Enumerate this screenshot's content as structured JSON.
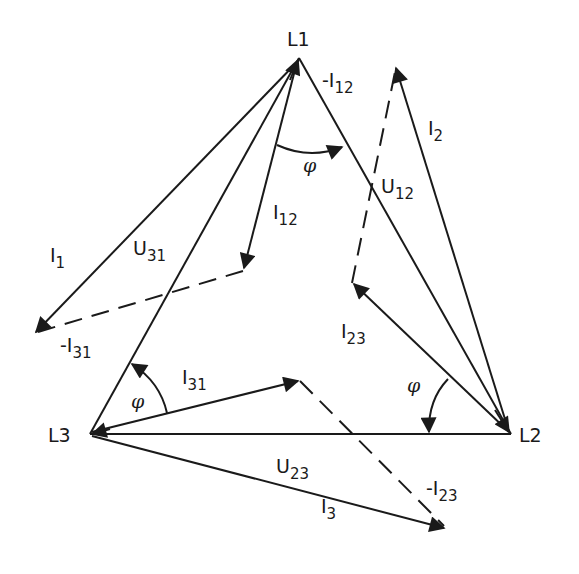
{
  "diagram": {
    "type": "three-phase delta phasor diagram",
    "colors": {
      "line": "#1a1a1a",
      "background": "#ffffff"
    },
    "nodes": {
      "L1": {
        "label": "L1",
        "x": 299,
        "y": 58
      },
      "L2": {
        "label": "L2",
        "x": 511,
        "y": 434
      },
      "L3": {
        "label": "L3",
        "x": 90,
        "y": 434
      }
    },
    "voltages": [
      {
        "name": "U12",
        "main": "U",
        "sub": "12",
        "from": "L1",
        "to": "L2"
      },
      {
        "name": "U23",
        "main": "U",
        "sub": "23",
        "from": "L2",
        "to": "L3"
      },
      {
        "name": "U31",
        "main": "U",
        "sub": "31",
        "from": "L3",
        "to": "L1"
      }
    ],
    "currents": [
      {
        "name": "I1",
        "main": "I",
        "sub": "1",
        "style": "solid"
      },
      {
        "name": "I2",
        "main": "I",
        "sub": "2",
        "style": "solid"
      },
      {
        "name": "I3",
        "main": "I",
        "sub": "3",
        "style": "solid"
      },
      {
        "name": "I12",
        "main": "I",
        "sub": "12",
        "style": "solid"
      },
      {
        "name": "I23",
        "main": "I",
        "sub": "23",
        "style": "solid"
      },
      {
        "name": "I31",
        "main": "I",
        "sub": "31",
        "style": "solid"
      },
      {
        "name": "-I12",
        "main": "-I",
        "sub": "12",
        "style": "dashed"
      },
      {
        "name": "-I23",
        "main": "-I",
        "sub": "23",
        "style": "dashed"
      },
      {
        "name": "-I31",
        "main": "-I",
        "sub": "31",
        "style": "dashed"
      }
    ],
    "angle_symbol": "φ",
    "angles": [
      {
        "name": "phi-at-L1",
        "label": "φ"
      },
      {
        "name": "phi-at-L2",
        "label": "φ"
      },
      {
        "name": "phi-at-L3",
        "label": "φ"
      }
    ]
  }
}
